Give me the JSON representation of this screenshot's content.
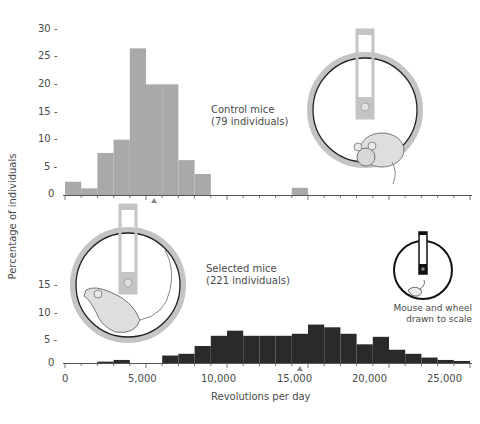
{
  "chart_data": [
    {
      "type": "bar",
      "title": "Control mice",
      "subtitle": "(79 individuals)",
      "xlabel": "Revolutions per day",
      "ylabel": "Percentage of individuals",
      "bin_width": 1000,
      "bins_start": [
        0,
        1000,
        2000,
        3000,
        4000,
        5000,
        6000,
        7000,
        8000,
        14000
      ],
      "values": [
        2.4,
        1.2,
        7.6,
        10,
        26.5,
        20,
        20,
        6.3,
        3.8,
        1.3
      ],
      "yticks": [
        0,
        5,
        10,
        15,
        20,
        25,
        30
      ],
      "ylim": [
        0,
        30
      ],
      "xlim": [
        0,
        25000
      ],
      "mean_marker": 5500,
      "color": "#a9a9a9",
      "grid": false
    },
    {
      "type": "bar",
      "title": "Selected mice",
      "subtitle": "(221 individuals)",
      "xlabel": "Revolutions per day",
      "ylabel": "Percentage of individuals",
      "bin_width": 1000,
      "bins_start": [
        2000,
        3000,
        6000,
        7000,
        8000,
        9000,
        10000,
        11000,
        12000,
        13000,
        14000,
        15000,
        16000,
        17000,
        18000,
        19000,
        20000,
        21000,
        22000,
        23000,
        24000
      ],
      "values": [
        0.4,
        0.9,
        2.2,
        2.7,
        5,
        8,
        9.5,
        8,
        8,
        8,
        8.6,
        11.3,
        10.5,
        8.6,
        5.5,
        7.7,
        3.9,
        2.7,
        1.6,
        0.9,
        0.6
      ],
      "yticks": [
        0,
        5,
        10,
        15
      ],
      "ylim": [
        0,
        15
      ],
      "xticks": [
        0,
        5000,
        10000,
        15000,
        20000,
        25000
      ],
      "xlim": [
        0,
        25000
      ],
      "mean_marker": 14500,
      "color": "#2a2a2a",
      "grid": false
    }
  ],
  "labels": {
    "control_title": "Control mice",
    "control_count": "(79 individuals)",
    "selected_title": "Selected mice",
    "selected_count": "(221 individuals)",
    "ylabel": "Percentage of individuals",
    "xlabel": "Revolutions per day",
    "scale_note_1": "Mouse and wheel",
    "scale_note_2": "drawn to scale",
    "top_yticks": [
      "30 -",
      "25 -",
      "20 -",
      "15 -",
      "10 -",
      "5 -",
      "0"
    ],
    "bottom_yticks": [
      "15 -",
      "10 -",
      "5 -",
      "0"
    ],
    "xticks": [
      "0",
      "5,000",
      "10,000",
      "15,000",
      "20,000",
      "25,000"
    ]
  },
  "illustrations": {
    "control_wheel": "mouse-in-wheel-icon",
    "selected_wheel": "running-mouse-in-wheel-icon",
    "scale_wheel": "small-mouse-wheel-icon"
  }
}
